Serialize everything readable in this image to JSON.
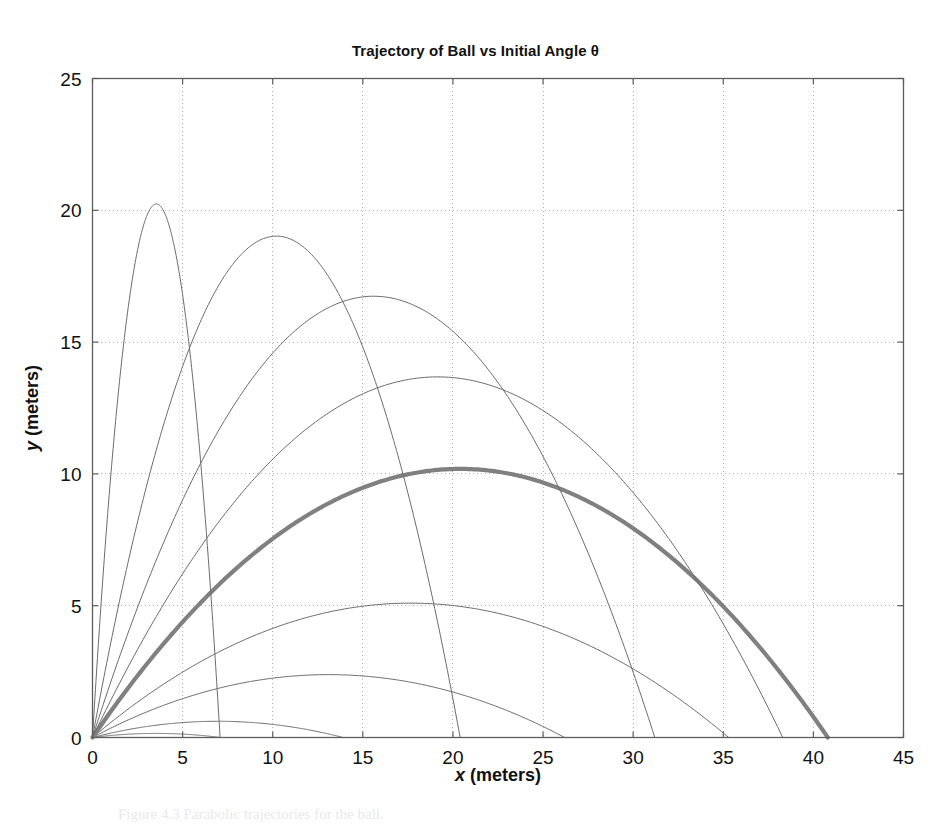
{
  "figure": {
    "caption": "Figure 4.3   Parabolic trajectories for the ball."
  },
  "chart_data": {
    "type": "line",
    "title": "Trajectory of Ball vs Initial Angle θ",
    "xlabel": "x (meters)",
    "ylabel": "y (meters)",
    "xlabel_var": "x",
    "xlabel_unit": " (meters)",
    "ylabel_var": "y",
    "ylabel_unit": " (meters)",
    "xlim": [
      0,
      45
    ],
    "ylim": [
      0,
      25
    ],
    "xticks": [
      0,
      5,
      10,
      15,
      20,
      25,
      30,
      35,
      40,
      45
    ],
    "yticks": [
      0,
      5,
      10,
      15,
      20,
      25
    ],
    "xtick_labels": [
      "0",
      "5",
      "10",
      "15",
      "20",
      "25",
      "30",
      "35",
      "40",
      "45"
    ],
    "ytick_labels": [
      "0",
      "5",
      "10",
      "15",
      "20",
      "25"
    ],
    "grid": true,
    "grid_style": "dotted",
    "legend": false,
    "initial_speed_mps": 20,
    "gravity_mps2": 9.81,
    "angle_unit": "degrees",
    "series": [
      {
        "name": "theta = 5",
        "angle_deg": 5,
        "range": 7.1,
        "apex_x": 3.54,
        "apex_y": 0.155,
        "color": "#6b6b6b",
        "width": 1,
        "emphasis": false
      },
      {
        "name": "theta = 10",
        "angle_deg": 10,
        "range": 13.9,
        "apex_x": 6.97,
        "apex_y": 0.615,
        "color": "#6b6b6b",
        "width": 1,
        "emphasis": false
      },
      {
        "name": "theta = 20",
        "angle_deg": 20,
        "range": 26.2,
        "apex_x": 13.1,
        "apex_y": 2.385,
        "color": "#6b6b6b",
        "width": 1,
        "emphasis": false
      },
      {
        "name": "theta = 30",
        "angle_deg": 30,
        "range": 35.3,
        "apex_x": 17.65,
        "apex_y": 5.097,
        "color": "#6b6b6b",
        "width": 1,
        "emphasis": false
      },
      {
        "name": "theta = 45",
        "angle_deg": 45,
        "range": 40.8,
        "apex_x": 20.39,
        "apex_y": 10.19,
        "color": "#808080",
        "width": 4.2,
        "emphasis": true
      },
      {
        "name": "theta = 55",
        "angle_deg": 55,
        "range": 38.3,
        "apex_x": 19.15,
        "apex_y": 13.68,
        "color": "#6b6b6b",
        "width": 1,
        "emphasis": false
      },
      {
        "name": "theta = 65",
        "angle_deg": 65,
        "range": 31.2,
        "apex_x": 15.62,
        "apex_y": 16.74,
        "color": "#6b6b6b",
        "width": 1,
        "emphasis": false
      },
      {
        "name": "theta = 75",
        "angle_deg": 75,
        "range": 20.4,
        "apex_x": 10.19,
        "apex_y": 19.02,
        "color": "#6b6b6b",
        "width": 1,
        "emphasis": false
      },
      {
        "name": "theta = 85",
        "angle_deg": 85,
        "range": 7.08,
        "apex_x": 3.54,
        "apex_y": 20.24,
        "color": "#6b6b6b",
        "width": 1,
        "emphasis": false
      }
    ]
  }
}
